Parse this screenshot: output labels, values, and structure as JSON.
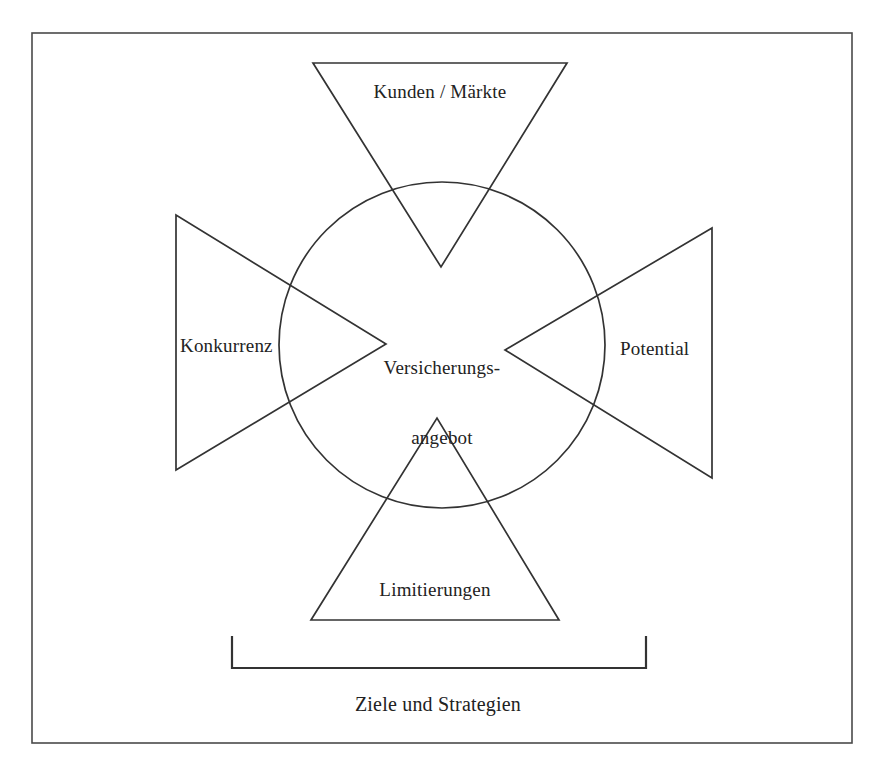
{
  "page": {
    "background_color": "#ffffff",
    "line_color": "#333333",
    "text_color": "#222222",
    "width": 888,
    "height": 781
  },
  "frame": {
    "name": "outer-border",
    "x": 32,
    "y": 33,
    "width": 820,
    "height": 710
  },
  "center": {
    "label_line1": "Versicherungs-",
    "label_line2": "angebot",
    "circle": {
      "cx": 442,
      "cy": 345,
      "r": 163
    }
  },
  "wedges": [
    {
      "id": "top",
      "label": "Kunden / Märkte",
      "orientation": "points-down",
      "points": "313,63 567,63 441,267"
    },
    {
      "id": "left",
      "label": "Konkurrenz",
      "orientation": "points-right",
      "points": "176,215 176,470 386,344"
    },
    {
      "id": "right",
      "label": "Potential",
      "orientation": "points-left",
      "points": "712,228 712,478 505,350"
    },
    {
      "id": "bottom",
      "label": "Limitierungen",
      "orientation": "points-up",
      "points": "311,620 559,620 437,418"
    }
  ],
  "bracket": {
    "label": "Ziele und Strategien",
    "left_x": 232,
    "right_x": 646,
    "top_y": 636,
    "bottom_y": 668
  },
  "artifact": {
    "top_cropped_text": "    "
  }
}
